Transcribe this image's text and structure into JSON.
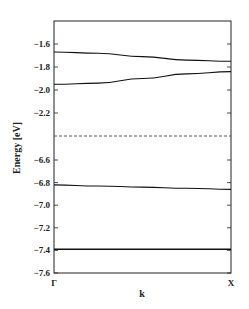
{
  "chart_data": {
    "type": "line",
    "title": "",
    "xlabel": "k",
    "ylabel": "Energy [eV]",
    "x_ticks": [
      "Γ",
      "X"
    ],
    "y_ticks_upper": [
      "-1.6",
      "-1.8",
      "-2.0",
      "-2.2"
    ],
    "y_ticks_lower": [
      "-6.6",
      "-6.8",
      "-7.0",
      "-7.2",
      "-7.4",
      "-7.6"
    ],
    "axis_break": "dashed line between -2.2 and -6.6 (broken y-axis)",
    "grid": false,
    "series": [
      {
        "name": "band1",
        "x": [
          0,
          0.25,
          0.5,
          0.75,
          1.0
        ],
        "values": [
          -1.67,
          -1.68,
          -1.71,
          -1.74,
          -1.75
        ]
      },
      {
        "name": "band2",
        "x": [
          0,
          0.25,
          0.5,
          0.75,
          1.0
        ],
        "values": [
          -1.95,
          -1.94,
          -1.9,
          -1.86,
          -1.84
        ]
      },
      {
        "name": "band3",
        "x": [
          0,
          0.25,
          0.5,
          0.75,
          1.0
        ],
        "values": [
          -6.82,
          -6.83,
          -6.84,
          -6.85,
          -6.86
        ]
      },
      {
        "name": "band4",
        "x": [
          0,
          0.25,
          0.5,
          0.75,
          1.0
        ],
        "values": [
          -7.39,
          -7.39,
          -7.39,
          -7.39,
          -7.39
        ]
      }
    ]
  }
}
